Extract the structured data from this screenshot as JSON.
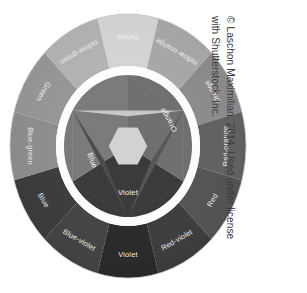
{
  "figure": {
    "name": "color-wheel",
    "type": "diagram",
    "background_color": "#ffffff",
    "credit_line_1": "© Laschon Maximilian, 2014. Used under license",
    "credit_line_2": "with Shutterstock, Inc.",
    "credit_color": "#3a3a3a",
    "credit_rotation_deg": 90
  },
  "wheel": {
    "outer_ring": {
      "segments": [
        {
          "label": "Yellow",
          "angle_deg": 0,
          "color": "#d6d6d6"
        },
        {
          "label": "Yellow-orange",
          "angle_deg": 30,
          "color": "#a9a9a9"
        },
        {
          "label": "Orange",
          "angle_deg": 60,
          "color": "#8d8d8d"
        },
        {
          "label": "Red-orange",
          "angle_deg": 90,
          "color": "#636363"
        },
        {
          "label": "Red",
          "angle_deg": 120,
          "color": "#565656"
        },
        {
          "label": "Red-violet",
          "angle_deg": 150,
          "color": "#3f3f3f"
        },
        {
          "label": "Violet",
          "angle_deg": 180,
          "color": "#2b2b2b"
        },
        {
          "label": "Blue-violet",
          "angle_deg": 210,
          "color": "#454545"
        },
        {
          "label": "Blue",
          "angle_deg": 240,
          "color": "#3d3d3d"
        },
        {
          "label": "Blue-green",
          "angle_deg": 270,
          "color": "#8f8f8f"
        },
        {
          "label": "Green",
          "angle_deg": 300,
          "color": "#989898"
        },
        {
          "label": "Yellow-green",
          "angle_deg": 330,
          "color": "#b4b4b4"
        }
      ]
    },
    "gap_ring": {
      "color": "#ffffff"
    },
    "inner_wheel": {
      "ring_segments": [
        {
          "label": "Orange",
          "angle_deg": 60,
          "color": "#6f6f6f"
        },
        {
          "label": "Violet",
          "angle_deg": 180,
          "color": "#3a3a3a"
        },
        {
          "label": "",
          "angle_deg": 300,
          "color": "#7a7a7a"
        }
      ],
      "primary_triangles": [
        {
          "label": "",
          "angle_deg": 0,
          "color": "#c8c8c8"
        },
        {
          "label": "Blue",
          "angle_deg": 240,
          "color": "#4a4a4a"
        },
        {
          "label": "",
          "angle_deg": 120,
          "color": "#565656"
        }
      ],
      "center_color": "#d2d2d2",
      "labels": [
        {
          "text": "Orange"
        },
        {
          "text": "Blue"
        },
        {
          "text": "Violet"
        }
      ]
    }
  }
}
